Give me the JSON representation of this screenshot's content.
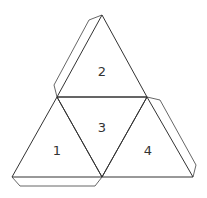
{
  "diagram": {
    "type": "tetrahedron-net",
    "stroke_color": "#333333",
    "background": "#ffffff",
    "faces": [
      {
        "id": "face-1",
        "label": "1",
        "points": "12,177 57,97 102,177",
        "label_x": 57,
        "label_y": 155
      },
      {
        "id": "face-2",
        "label": "2",
        "points": "57,97 102,15 147,97",
        "label_x": 102,
        "label_y": 76
      },
      {
        "id": "face-3",
        "label": "3",
        "points": "57,97 147,97 102,177",
        "label_x": 102,
        "label_y": 132
      },
      {
        "id": "face-4",
        "label": "4",
        "points": "102,177 147,97 193,177",
        "label_x": 148,
        "label_y": 155
      }
    ],
    "tabs": [
      {
        "id": "tab-face-2-left",
        "points": "57,97 54,85 89,20 102,15"
      },
      {
        "id": "tab-face-4-right",
        "points": "147,97 160,100 196,165 193,177"
      },
      {
        "id": "tab-face-1-bottom",
        "points": "12,177 20,186 95,186 102,177"
      }
    ]
  }
}
